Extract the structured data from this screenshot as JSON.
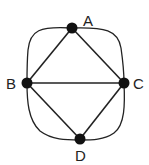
{
  "diagram": {
    "type": "graph",
    "nodes": [
      {
        "id": "A",
        "label": "A",
        "x": 72,
        "y": 28
      },
      {
        "id": "B",
        "label": "B",
        "x": 27,
        "y": 83
      },
      {
        "id": "C",
        "label": "C",
        "x": 124,
        "y": 83
      },
      {
        "id": "D",
        "label": "D",
        "x": 80,
        "y": 139
      }
    ],
    "straight_edges": [
      [
        "A",
        "B"
      ],
      [
        "A",
        "C"
      ],
      [
        "B",
        "C"
      ],
      [
        "B",
        "D"
      ],
      [
        "C",
        "D"
      ]
    ],
    "curved_edges": [
      [
        "A",
        "B"
      ],
      [
        "A",
        "C"
      ],
      [
        "B",
        "D"
      ],
      [
        "C",
        "D"
      ]
    ],
    "colors": {
      "edge": "#222222",
      "node": "#111111"
    }
  }
}
